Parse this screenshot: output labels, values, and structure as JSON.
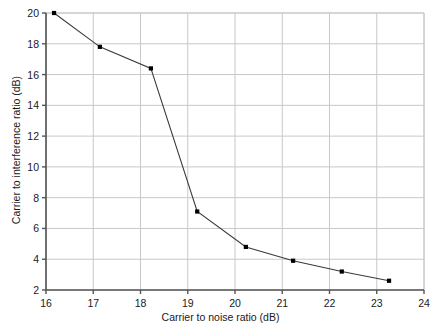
{
  "chart_data": {
    "type": "line",
    "title": "",
    "subtitle": "",
    "xlabel": "Carrier to noise ratio (dB)",
    "ylabel": "Carrier to interference ratio (dB)",
    "xlim": [
      16,
      24
    ],
    "ylim": [
      2,
      20
    ],
    "xticks": [
      16,
      17,
      18,
      19,
      20,
      21,
      22,
      23,
      24
    ],
    "yticks": [
      2,
      4,
      6,
      8,
      10,
      12,
      14,
      16,
      18,
      20
    ],
    "xtick_labels": [
      "16",
      "17",
      "18",
      "19",
      "20",
      "21",
      "22",
      "23",
      "24"
    ],
    "ytick_labels": [
      "2",
      "4",
      "6",
      "8",
      "10",
      "12",
      "14",
      "16",
      "18",
      "20"
    ],
    "grid": true,
    "grid_color": "#c8c8c8",
    "legend": false,
    "legend_position": "none",
    "line_color": "#3a3a3a",
    "marker": "square",
    "marker_color": "#000000",
    "series": [
      {
        "name": "Carrier to interference ratio",
        "x": [
          16.17,
          17.14,
          18.22,
          19.2,
          20.23,
          21.23,
          22.26,
          23.26
        ],
        "values": [
          20.0,
          17.8,
          16.4,
          7.1,
          4.8,
          3.9,
          3.2,
          2.6
        ]
      }
    ]
  }
}
